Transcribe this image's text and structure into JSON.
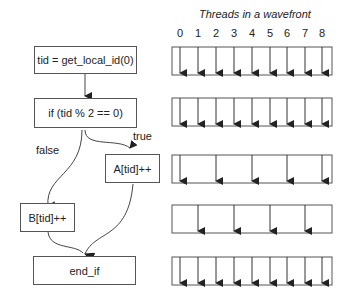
{
  "flowchart": {
    "nodes": [
      {
        "id": "n1",
        "label": "tid = get_local_id(0)"
      },
      {
        "id": "n2",
        "label": "if (tid % 2 == 0)"
      },
      {
        "id": "n3",
        "label": "A[tid]++"
      },
      {
        "id": "n4",
        "label": "B[tid]++"
      },
      {
        "id": "n5",
        "label": "end_if"
      }
    ],
    "edges": [
      {
        "from": "n1",
        "to": "n2",
        "label": ""
      },
      {
        "from": "n2",
        "to": "n3",
        "label": "true"
      },
      {
        "from": "n2",
        "to": "n4",
        "label": "false"
      },
      {
        "from": "n3",
        "to": "n5",
        "label": ""
      },
      {
        "from": "n4",
        "to": "n5",
        "label": ""
      }
    ]
  },
  "wavefront": {
    "title": "Threads in a wavefront",
    "thread_ids": [
      "0",
      "1",
      "2",
      "3",
      "4",
      "5",
      "6",
      "7",
      "8"
    ],
    "rows": [
      {
        "node": "n1",
        "active_threads": [
          0,
          1,
          2,
          3,
          4,
          5,
          6,
          7,
          8
        ]
      },
      {
        "node": "n2",
        "active_threads": [
          0,
          1,
          2,
          3,
          4,
          5,
          6,
          7,
          8
        ]
      },
      {
        "node": "n3",
        "active_threads": [
          0,
          2,
          4,
          6,
          8
        ]
      },
      {
        "node": "n4",
        "active_threads": [
          1,
          3,
          5,
          7
        ]
      },
      {
        "node": "n5",
        "active_threads": [
          0,
          1,
          2,
          3,
          4,
          5,
          6,
          7,
          8
        ]
      }
    ]
  }
}
